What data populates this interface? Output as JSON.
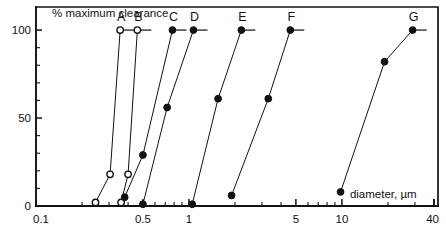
{
  "chart_data": {
    "type": "line",
    "title": "% maximum clearance",
    "xlabel": "diameter, µm",
    "ylabel": "% maximum clearance",
    "xscale": "log",
    "xlim": [
      0.1,
      40
    ],
    "ylim": [
      0,
      108
    ],
    "grid": false,
    "legend": "inline-end-labels",
    "xticks": [
      0.1,
      0.5,
      1,
      5,
      10,
      40
    ],
    "xtick_labels": [
      "0.1",
      "0.5",
      "1",
      "5",
      "10",
      "40"
    ],
    "yticks": [
      0,
      50,
      100
    ],
    "ytick_labels": [
      "0",
      "50",
      "100"
    ],
    "yminor_step": 10,
    "series": [
      {
        "name": "A",
        "marker": "open-circle",
        "x": [
          0.245,
          0.305,
          0.355
        ],
        "y": [
          2,
          18,
          100
        ]
      },
      {
        "name": "B",
        "marker": "open-circle",
        "x": [
          0.36,
          0.4,
          0.46
        ],
        "y": [
          2,
          18,
          100
        ]
      },
      {
        "name": "C",
        "marker": "filled-circle",
        "x": [
          0.38,
          0.5,
          0.78
        ],
        "y": [
          5,
          29,
          100
        ]
      },
      {
        "name": "D",
        "marker": "filled-circle",
        "x": [
          0.5,
          0.72,
          1.07
        ],
        "y": [
          1,
          56,
          100
        ]
      },
      {
        "name": "E",
        "marker": "filled-circle",
        "x": [
          1.05,
          1.55,
          2.2
        ],
        "y": [
          1,
          61,
          100
        ]
      },
      {
        "name": "F",
        "marker": "filled-circle",
        "x": [
          1.9,
          3.3,
          4.6
        ],
        "y": [
          6,
          61,
          100
        ]
      },
      {
        "name": "G",
        "marker": "filled-circle",
        "x": [
          9.8,
          19.0,
          29.0
        ],
        "y": [
          8,
          82,
          100
        ]
      }
    ]
  }
}
